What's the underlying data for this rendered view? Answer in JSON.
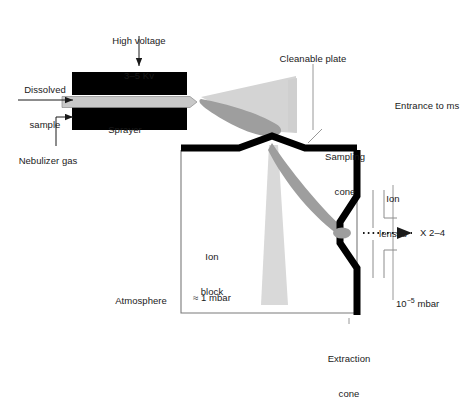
{
  "figure": {
    "colors": {
      "ink": "#1a1a1a",
      "black_body": "#000000",
      "plume_light": "#d2d2d2",
      "plume_mid": "#9e9e9e",
      "capillary": "#c8c8c8",
      "thin_line": "#8c8c8c",
      "background": "#ffffff"
    }
  },
  "labels": {
    "high_voltage": {
      "line1": "High voltage",
      "line2": "3–5 Kv",
      "x": 139,
      "y": 12
    },
    "dissolved_sample": {
      "line1": "Dissolved",
      "line2": "sample",
      "x": 45,
      "y": 61
    },
    "sprayer": {
      "text": "Sprayer",
      "x": 125,
      "y": 124
    },
    "nebulizer_gas": {
      "text": "Nebulizer gas",
      "x": 48,
      "y": 155
    },
    "cleanable_plate": {
      "text": "Cleanable plate",
      "x": 313,
      "y": 53
    },
    "sampling_cone": {
      "line1": "Sampling",
      "line2": "cone",
      "x": 345,
      "y": 128
    },
    "entrance_to_ms": {
      "text": "Entrance to ms",
      "x": 427,
      "y": 100
    },
    "ion_lenses": {
      "line1": "Ion",
      "line2": "lenses",
      "x": 393,
      "y": 170
    },
    "multiplier": {
      "text": "X 2–4",
      "x": 434,
      "y": 233
    },
    "ion_block": {
      "line1": "Ion",
      "line2": "block",
      "x": 212,
      "y": 228
    },
    "pressure_source": {
      "text": "≈ 1 mbar",
      "x": 212,
      "y": 292
    },
    "atmosphere": {
      "text": "Atmosphere",
      "x": 141,
      "y": 295
    },
    "extraction_cone": {
      "line1": "Extraction",
      "line2": "cone",
      "x": 349,
      "y": 330
    },
    "pressure_analyser": {
      "prefix": "10",
      "exponent": "−5",
      "suffix": " mbar",
      "x": 420,
      "y": 304
    }
  },
  "components": {
    "sprayer_block_upper": "upper black sprayer body",
    "sprayer_block_lower": "lower black sprayer body",
    "capillary": "grey sprayer capillary with pointed tip",
    "spray_plume": "light grey expanding spray cone",
    "charged_droplet_beam": "dark grey droplet beam lens shape",
    "cleanable_plate": "light grey quadrilateral plate",
    "ion_block_chamber": "rectangular ion block enclosure",
    "sampling_cone": "thick black V sampling cone",
    "extraction_cone": "thick black chevron extraction cone",
    "ion_lens_stack": "four thin ion lens electrodes",
    "dotted_beam_arrow": "dotted ion beam arrow to detector",
    "supersonic_jet": "light grey supersonic expansion jet"
  }
}
